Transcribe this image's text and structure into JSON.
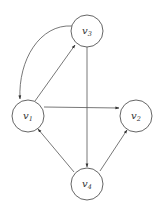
{
  "diagram": {
    "type": "directed-graph",
    "nodes": [
      {
        "id": "v3",
        "label": "v",
        "sub": "3",
        "cx": 87,
        "cy": 31,
        "r": 16
      },
      {
        "id": "v1",
        "label": "v",
        "sub": "1",
        "cx": 28,
        "cy": 116,
        "r": 16
      },
      {
        "id": "v2",
        "label": "v",
        "sub": "2",
        "cx": 136,
        "cy": 116,
        "r": 16
      },
      {
        "id": "v4",
        "label": "v",
        "sub": "4",
        "cx": 87,
        "cy": 184,
        "r": 16
      }
    ],
    "edges": [
      {
        "from": "v3",
        "to": "v1",
        "style": "curved"
      },
      {
        "from": "v1",
        "to": "v3",
        "style": "straight"
      },
      {
        "from": "v3",
        "to": "v4",
        "style": "straight"
      },
      {
        "from": "v1",
        "to": "v2",
        "style": "straight"
      },
      {
        "from": "v4",
        "to": "v1",
        "style": "straight"
      },
      {
        "from": "v4",
        "to": "v2",
        "style": "straight"
      }
    ],
    "colors": {
      "stroke": "#555555",
      "text": "#333333",
      "background": "#ffffff"
    }
  }
}
